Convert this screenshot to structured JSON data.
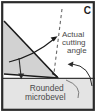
{
  "figure": {
    "panel_letter": "C",
    "labels": {
      "cutting_angle": {
        "line1": "Actual",
        "line2": "cutting",
        "line3": "angle",
        "full": "Actual cutting angle"
      },
      "microbevel": {
        "line1": "Rounded",
        "line2": "microbevel",
        "full": "Rounded microbevel"
      }
    },
    "colors": {
      "blade_fill": "#d6d6d6",
      "strip_fill": "#e4e4e4",
      "outline": "#1a1a1a",
      "text": "#434343",
      "background": "#ffffff",
      "border": "#2b2b2b"
    },
    "elements": {
      "blade_wedge": "gray-wedge-cross-section",
      "dashed_reference_line": "vertical-dashed-reference",
      "angle_arc_arrow": "arc-with-arrowhead-to-dashed-line",
      "down_arrow": "downward-force-arrow",
      "curved_pointer": "curved-arrow-to-blade-tip",
      "workpiece_strip": "horizontal-material-strip"
    }
  }
}
